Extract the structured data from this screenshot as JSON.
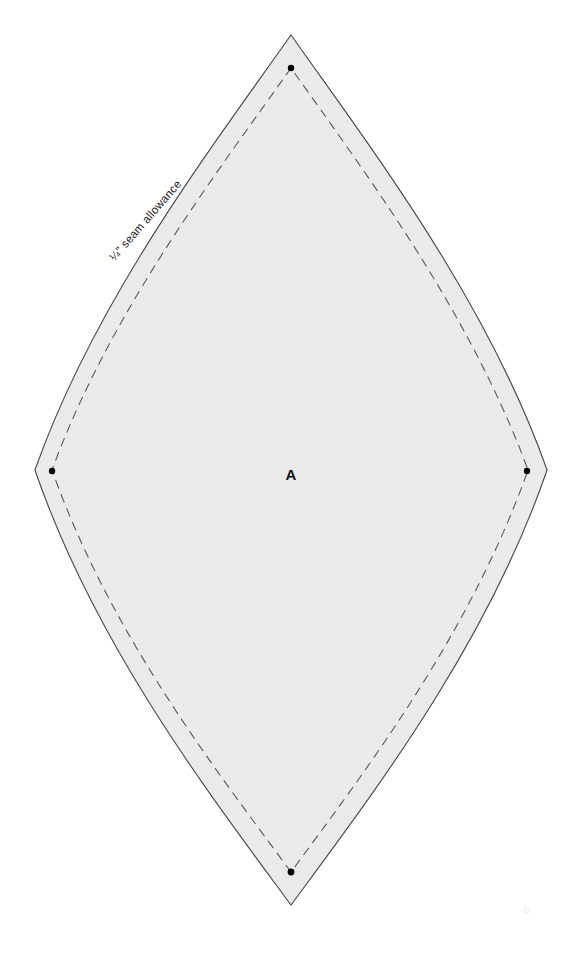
{
  "document": {
    "type": "sewing-pattern-template",
    "background_color": "#ffffff"
  },
  "pattern_piece": {
    "label": "A",
    "shape_name": "lens-petal",
    "fill_color": "#e9e9e9",
    "outline_color": "#303030",
    "outline_width": 1.1,
    "cut_line_name": "cut-line",
    "geometry": {
      "top_tip": [
        291,
        35
      ],
      "bottom_tip": [
        291,
        905
      ],
      "left_point": [
        35,
        470
      ],
      "right_point": [
        547,
        470
      ]
    }
  },
  "seam_allowance": {
    "label": "¼\" seam allowance",
    "line_color": "#595959",
    "line_width": 1.1,
    "dash_pattern": "9 6",
    "offset_px": 18,
    "geometry": {
      "top_point": [
        291,
        68
      ],
      "bottom_point": [
        291,
        872
      ],
      "left_point": [
        52,
        470
      ],
      "right_point": [
        528,
        470
      ]
    },
    "label_position": [
      146,
      221
    ],
    "label_rotation_deg": -49
  },
  "registration_dots": {
    "color": "#000000",
    "radius": 3.2,
    "points": [
      {
        "name": "dot-top",
        "x": 291,
        "y": 68
      },
      {
        "name": "dot-left",
        "x": 52,
        "y": 471
      },
      {
        "name": "dot-right",
        "x": 527,
        "y": 471
      },
      {
        "name": "dot-bottom",
        "x": 291,
        "y": 872
      }
    ]
  },
  "piece_label": {
    "text": "A",
    "x": 291,
    "y": 476,
    "color": "#111111"
  }
}
